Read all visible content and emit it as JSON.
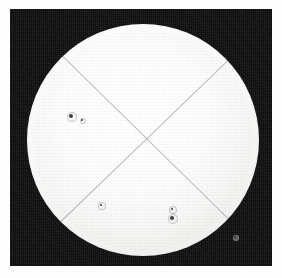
{
  "image": {
    "title": "Solar Disk Photograph",
    "subject": "Sun",
    "medium": "monochrome photographic plate",
    "margin_color": "#fdfdfd",
    "plate_background_color": "#0b0b0b",
    "disk_color": "#ffffff"
  },
  "plate": {
    "x": 10,
    "y": 9,
    "width": 262,
    "height": 257
  },
  "chart_data": {
    "type": "scatter",
    "xlabel": "",
    "ylabel": "",
    "disk": {
      "center_x": 143,
      "center_y": 140,
      "radius": 116,
      "limb_darkening": true
    },
    "reticle_lines": [
      {
        "name": "diagonal-nw-se",
        "x1": 62,
        "y1": 55,
        "x2": 228,
        "y2": 218
      },
      {
        "name": "diagonal-ne-sw",
        "x1": 228,
        "y1": 60,
        "x2": 60,
        "y2": 222
      }
    ],
    "sunspots": [
      {
        "name": "group-a-leader",
        "x": 71,
        "y": 116,
        "radius": 2.4,
        "penumbra_radius": 4.2
      },
      {
        "name": "group-a-follower",
        "x": 82,
        "y": 120,
        "radius": 1.4,
        "penumbra_radius": 2.4
      },
      {
        "name": "group-b-pore",
        "x": 101,
        "y": 205,
        "radius": 1.3,
        "penumbra_radius": 2.6
      },
      {
        "name": "group-c-upper",
        "x": 172,
        "y": 209,
        "radius": 1.2,
        "penumbra_radius": 3.0
      },
      {
        "name": "group-c-main",
        "x": 172,
        "y": 218,
        "radius": 2.2,
        "penumbra_radius": 4.4
      },
      {
        "name": "group-d-limb",
        "x": 235,
        "y": 237,
        "radius": 1.2,
        "penumbra_radius": 2.2
      }
    ],
    "legend": [],
    "grid": false
  }
}
